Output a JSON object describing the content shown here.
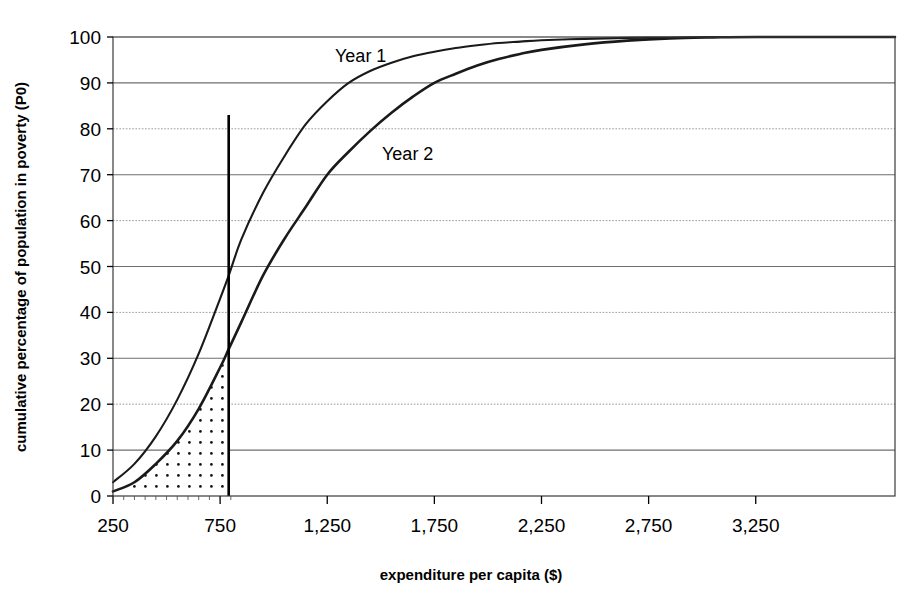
{
  "chart_data": {
    "type": "line",
    "title": "",
    "xlabel": "expenditure per capita ($)",
    "ylabel": "cumulative percentage of population in poverty (P0)",
    "xlim": [
      250,
      3900
    ],
    "ylim": [
      0,
      100
    ],
    "grid": true,
    "legend_position": "inline-annotation",
    "x_ticks": [
      "250",
      "750",
      "1,250",
      "1,750",
      "2,250",
      "2,750",
      "3,250"
    ],
    "x_tick_values": [
      250,
      750,
      1250,
      1750,
      2250,
      2750,
      3250
    ],
    "y_ticks": [
      "0",
      "10",
      "20",
      "30",
      "40",
      "50",
      "60",
      "70",
      "80",
      "90",
      "100"
    ],
    "y_tick_values": [
      0,
      10,
      20,
      30,
      40,
      50,
      60,
      70,
      80,
      90,
      100
    ],
    "x": [
      250,
      350,
      450,
      550,
      650,
      750,
      790,
      850,
      950,
      1050,
      1150,
      1250,
      1350,
      1450,
      1550,
      1650,
      1750,
      1850,
      1950,
      2050,
      2150,
      2250,
      2450,
      2650,
      2850,
      3050,
      3250,
      3900
    ],
    "series": [
      {
        "name": "Year 1",
        "label": "Year 1",
        "color": "#1a1a1a",
        "values": [
          3,
          7,
          13,
          21,
          31,
          43,
          48,
          56,
          66,
          74,
          81,
          86,
          90,
          92.6,
          94.4,
          95.8,
          96.8,
          97.6,
          98.2,
          98.7,
          99.0,
          99.3,
          99.6,
          99.8,
          99.9,
          100,
          100,
          100
        ]
      },
      {
        "name": "Year 2",
        "label": "Year 2",
        "color": "#1a1a1a",
        "values": [
          1,
          3,
          7,
          12,
          19,
          28,
          32,
          38,
          48,
          56,
          63,
          70,
          75,
          79.5,
          83.5,
          87,
          90,
          92,
          93.8,
          95.2,
          96.3,
          97.2,
          98.4,
          99.2,
          99.7,
          99.9,
          100,
          100
        ]
      }
    ],
    "annotations": [
      {
        "name": "poverty-line",
        "type": "vline",
        "x": 790,
        "y_top": 83,
        "y_bottom": 0,
        "color": "#000000"
      },
      {
        "name": "poverty-gap-area",
        "type": "fill",
        "pattern": "dotted",
        "under_series": "Year 2",
        "x_from": 250,
        "x_to": 790
      }
    ]
  },
  "labels": {
    "series_1": "Year 1",
    "series_2": "Year 2",
    "x_axis_title": "expenditure per capita ($)",
    "y_axis_title": "cumulative percentage of population in poverty (P0)"
  },
  "ticks": {
    "x": [
      "250",
      "750",
      "1,250",
      "1,750",
      "2,250",
      "2,750",
      "3,250"
    ],
    "y": [
      "100",
      "90",
      "80",
      "70",
      "60",
      "50",
      "40",
      "30",
      "20",
      "10",
      "0"
    ]
  },
  "colors": {
    "line": "#1a1a1a",
    "grid": "#808080",
    "axis": "#000000",
    "background": "#ffffff"
  }
}
